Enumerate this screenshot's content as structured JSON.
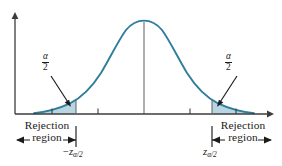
{
  "figure": {
    "type": "statistical-distribution-diagram",
    "colors": {
      "curve": "#2e7d9a",
      "fill": "#b9d5e2",
      "axis": "#3c3c3c",
      "center_line": "#6b6b6b",
      "text": "#1b1b1b"
    }
  },
  "curve": {
    "name": "standard-normal-curve",
    "peak_x": 144,
    "baseline_y": 114,
    "peak_y": 21
  },
  "axes": {
    "x_axis": {
      "name": "horizontal-axis",
      "y": 114,
      "x_start": 15,
      "x_end": 272,
      "arrow": "right"
    },
    "y_axis": {
      "name": "vertical-axis",
      "x": 15,
      "y_top": 14,
      "y_bottom": 114,
      "arrow": "up"
    },
    "ticks": [
      52,
      98,
      144,
      190,
      236
    ],
    "center_tick_line": {
      "x": 144,
      "y_top": 22,
      "y_bottom": 114
    }
  },
  "regions": {
    "left_tail": {
      "name": "left-rejection-region",
      "boundary_x": 76,
      "alpha_label": {
        "numerator": "α",
        "denominator": "2",
        "x": 46,
        "y": 58
      },
      "arrow": {
        "from_x": 52,
        "from_y": 76,
        "to_x": 70,
        "to_y": 105
      }
    },
    "right_tail": {
      "name": "right-rejection-region",
      "boundary_x": 212,
      "alpha_label": {
        "numerator": "α",
        "denominator": "2",
        "x": 229,
        "y": 58
      },
      "arrow": {
        "from_x": 236,
        "from_y": 76,
        "to_x": 218,
        "to_y": 105
      }
    }
  },
  "annotations": {
    "left_rejection": {
      "line1": "Rejection",
      "line2": "region",
      "bracket": {
        "x_start": 17,
        "x_end": 76,
        "y": 140
      }
    },
    "right_rejection": {
      "line1": "Rejection",
      "line2": "region",
      "bracket": {
        "x_start": 212,
        "x_end": 271,
        "y": 140
      }
    },
    "left_z_label": {
      "sign": "−",
      "variable": "z",
      "subscript": "α/2",
      "x": 76,
      "y": 150
    },
    "right_z_label": {
      "sign": "",
      "variable": "z",
      "subscript": "α/2",
      "x": 212,
      "y": 150
    }
  }
}
